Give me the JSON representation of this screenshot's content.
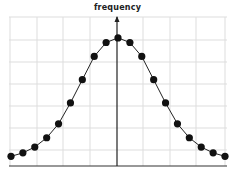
{
  "chart_data": {
    "type": "line",
    "title": "",
    "xlabel": "",
    "ylabel": "frequency",
    "grid": true,
    "legend": null,
    "x": [
      -9,
      -8,
      -7,
      -6,
      -5,
      -4,
      -3,
      -2,
      -1,
      0,
      1,
      2,
      3,
      4,
      5,
      6,
      7,
      8,
      9
    ],
    "values": [
      0.2,
      0.35,
      0.6,
      1.0,
      1.6,
      2.5,
      3.5,
      4.5,
      5.1,
      5.3,
      5.1,
      4.5,
      3.5,
      2.5,
      1.6,
      1.0,
      0.6,
      0.35,
      0.2
    ],
    "ylim": [
      0,
      6.5
    ],
    "line_color": "#222222",
    "marker_color": "#111111",
    "grid_color": "#dddddd"
  },
  "axis": {
    "y_label": "frequency"
  }
}
